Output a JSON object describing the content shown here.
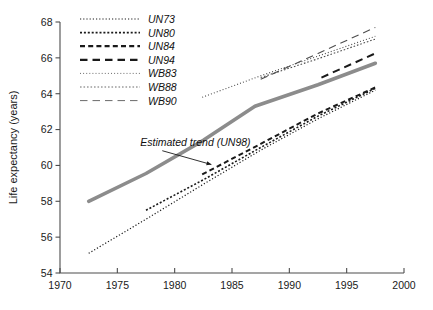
{
  "chart_data": {
    "type": "line",
    "title": "",
    "subtitle": "",
    "xlabel": "",
    "ylabel": "Life expectancy (years)",
    "xlim": [
      1970,
      2000
    ],
    "ylim": [
      54,
      68
    ],
    "xticks": [
      1970,
      1975,
      1980,
      1985,
      1990,
      1995,
      2000
    ],
    "xtick_labels": [
      "1970",
      "1975",
      "1980",
      "1985",
      "1990",
      "1995",
      "2000"
    ],
    "yticks": [
      54,
      56,
      58,
      60,
      62,
      64,
      66,
      68
    ],
    "ytick_labels": [
      "54",
      "56",
      "58",
      "60",
      "62",
      "64",
      "66",
      "68"
    ],
    "grid": false,
    "legend_position": "top-left",
    "annotations": [
      {
        "text": "Estimated trend (UN98)",
        "x": 1977.0,
        "y": 61.1,
        "points_to_x": 1983.2,
        "points_to_y": 60.05
      }
    ],
    "series": [
      {
        "name": "UN73",
        "style": "fine-dotted",
        "color": "#1a1a1a",
        "width": 1.2,
        "x": [
          1972.5,
          1977.5,
          1982.5,
          1987.5,
          1992.5,
          1997.5
        ],
        "y": [
          55.1,
          57.0,
          58.95,
          60.85,
          62.6,
          64.2
        ]
      },
      {
        "name": "UN80",
        "style": "dotted",
        "color": "#1a1a1a",
        "width": 1.6,
        "x": [
          1977.5,
          1982.5,
          1987.5,
          1992.5,
          1997.5
        ],
        "y": [
          57.5,
          59.2,
          61.0,
          62.75,
          64.3
        ]
      },
      {
        "name": "UN84",
        "style": "dashed",
        "color": "#1a1a1a",
        "width": 2.0,
        "x": [
          1982.4,
          1987.5,
          1992.5,
          1997.5
        ],
        "y": [
          59.5,
          61.2,
          62.9,
          64.35
        ]
      },
      {
        "name": "UN94",
        "style": "long-dashed",
        "color": "#1a1a1a",
        "width": 2.0,
        "x": [
          1992.8,
          1997.5
        ],
        "y": [
          64.9,
          66.25
        ]
      },
      {
        "name": "WB83",
        "style": "fine-dotted",
        "color": "#4d4d4d",
        "width": 1.1,
        "x": [
          1982.4,
          1987.5,
          1992.5,
          1997.5
        ],
        "y": [
          63.8,
          65.0,
          66.1,
          67.2
        ]
      },
      {
        "name": "WB88",
        "style": "small-dotted",
        "color": "#4d4d4d",
        "width": 1.1,
        "x": [
          1987.5,
          1992.5,
          1997.5
        ],
        "y": [
          64.9,
          65.95,
          67.05
        ]
      },
      {
        "name": "WB90",
        "style": "long-dashed",
        "color": "#4d4d4d",
        "width": 1.1,
        "x": [
          1987.5,
          1992.5,
          1997.5
        ],
        "y": [
          64.8,
          66.25,
          67.7
        ]
      },
      {
        "name": "UN98",
        "label": "Estimated trend (UN98)",
        "style": "solid-thick",
        "color": "#8c8c8c",
        "width": 3.6,
        "in_legend": false,
        "x": [
          1972.5,
          1977.5,
          1982.5,
          1987.0,
          1992.5,
          1997.5
        ],
        "y": [
          58.0,
          59.55,
          61.4,
          63.3,
          64.5,
          65.7
        ]
      }
    ],
    "legend_entries": [
      {
        "label": "UN73",
        "style": "fine-dotted",
        "color": "#1a1a1a",
        "width": 1.2
      },
      {
        "label": "UN80",
        "style": "dotted",
        "color": "#1a1a1a",
        "width": 1.7
      },
      {
        "label": "UN84",
        "style": "dashed",
        "color": "#1a1a1a",
        "width": 2.2
      },
      {
        "label": "UN94",
        "style": "long-dashed",
        "color": "#1a1a1a",
        "width": 2.2
      },
      {
        "label": "WB83",
        "style": "fine-dotted",
        "color": "#6b6b6b",
        "width": 1.0
      },
      {
        "label": "WB88",
        "style": "small-dotted",
        "color": "#6b6b6b",
        "width": 1.0
      },
      {
        "label": "WB90",
        "style": "long-dashed",
        "color": "#6b6b6b",
        "width": 1.0
      }
    ]
  }
}
